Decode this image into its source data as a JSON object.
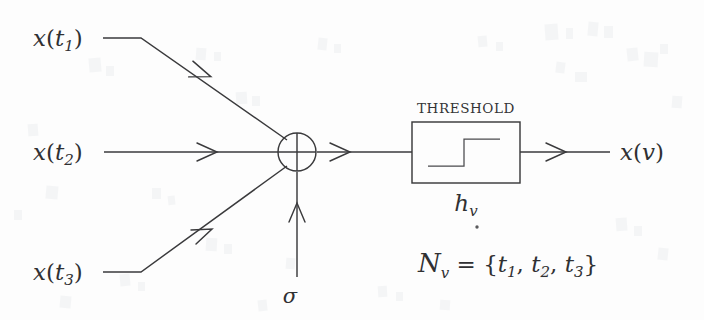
{
  "figure": {
    "caption_type": "neuron-threshold-unit-diagram",
    "background_color": "#fdfdfd",
    "ink_color": "#3a3a3c"
  },
  "inputs": [
    {
      "id": "input-1",
      "label_x": "x",
      "label_open": "(",
      "label_sub": "t",
      "label_sub_index": "1",
      "label_close": ")",
      "full_label": "x(t1)"
    },
    {
      "id": "input-2",
      "label_x": "x",
      "label_open": "(",
      "label_sub": "t",
      "label_sub_index": "2",
      "label_close": ")",
      "full_label": "x(t2)"
    },
    {
      "id": "input-3",
      "label_x": "x",
      "label_open": "(",
      "label_sub": "t",
      "label_sub_index": "3",
      "label_close": ")",
      "full_label": "x(t3)"
    }
  ],
  "adder": {
    "symbol": "+",
    "name": "summation-node"
  },
  "bias": {
    "label": "σ"
  },
  "threshold_block": {
    "title": "THRESHOLD",
    "sub_label_base": "h",
    "sub_label_sub": "v",
    "transfer_shape": "step-function"
  },
  "output": {
    "label_x": "x",
    "label_open": "(",
    "label_var": "v",
    "label_close": ")",
    "full_label": "x(v)"
  },
  "neighborhood_equation": {
    "script_n": "N",
    "script_n_sub": "v",
    "equals": "=",
    "open_brace": "{",
    "elements": [
      {
        "base": "t",
        "sub": "1"
      },
      {
        "base": "t",
        "sub": "2"
      },
      {
        "base": "t",
        "sub": "3"
      }
    ],
    "separator": ",",
    "close_brace": "}",
    "full_text": "Nv = {t1, t2, t3}"
  }
}
